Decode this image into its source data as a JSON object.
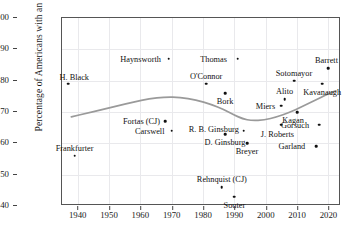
{
  "chart_data": {
    "type": "scatter",
    "title": "",
    "xlabel": "",
    "ylabel": "Percentage of Americans with an opinion",
    "xlim": [
      1935,
      2024
    ],
    "ylim": [
      40,
      100
    ],
    "xticks": [
      1940,
      1950,
      1960,
      1970,
      1980,
      1990,
      2000,
      2010,
      2020
    ],
    "yticks": [
      40,
      50,
      60,
      70,
      80,
      90,
      100
    ],
    "grid": true,
    "legend": "none",
    "points": [
      {
        "label": "Frankfurter",
        "x": 1939,
        "y": 56,
        "label_dx": 0,
        "label_dy": -8
      },
      {
        "label": "H. Black",
        "x": 1937,
        "y": 79,
        "label_dx": 6,
        "label_dy": -7
      },
      {
        "label": "Fortas (CJ)",
        "x": 1968,
        "y": 67,
        "label_dx": -24,
        "label_dy": 0
      },
      {
        "label": "Carswell",
        "x": 1970,
        "y": 64,
        "label_dx": -22,
        "label_dy": 0
      },
      {
        "label": "Haynsworth",
        "x": 1969,
        "y": 87,
        "label_dx": -28,
        "label_dy": 0
      },
      {
        "label": "O'Connor",
        "x": 1981,
        "y": 79,
        "label_dx": 0,
        "label_dy": -8
      },
      {
        "label": "Bork",
        "x": 1987,
        "y": 76,
        "label_dx": 0,
        "label_dy": 8
      },
      {
        "label": "Rehnquist (CJ)",
        "x": 1986,
        "y": 46,
        "label_dx": 0,
        "label_dy": -8
      },
      {
        "label": "Souter",
        "x": 1990,
        "y": 43,
        "label_dx": 0,
        "label_dy": 8
      },
      {
        "label": "Thomas",
        "x": 1991,
        "y": 87,
        "label_dx": -24,
        "label_dy": 0
      },
      {
        "label": "D. Ginsburg",
        "x": 1987,
        "y": 63,
        "label_dx": 0,
        "label_dy": 8
      },
      {
        "label": "R. B. Ginsburg",
        "x": 1993,
        "y": 64,
        "label_dx": -30,
        "label_dy": -2
      },
      {
        "label": "Breyer",
        "x": 1994,
        "y": 60,
        "label_dx": 0,
        "label_dy": 8
      },
      {
        "label": "Miers",
        "x": 2005,
        "y": 72,
        "label_dx": -16,
        "label_dy": 0
      },
      {
        "label": "Alito",
        "x": 2006,
        "y": 74,
        "label_dx": 0,
        "label_dy": -8
      },
      {
        "label": "Kagan",
        "x": 2010,
        "y": 70,
        "label_dx": -4,
        "label_dy": 8
      },
      {
        "label": "Sotomayor",
        "x": 2009,
        "y": 80,
        "label_dx": 0,
        "label_dy": -8
      },
      {
        "label": "J. Roberts",
        "x": 2005,
        "y": 66,
        "label_dx": -4,
        "label_dy": 9
      },
      {
        "label": "Gorsuch",
        "x": 2017,
        "y": 66,
        "label_dx": -24,
        "label_dy": 0
      },
      {
        "label": "Garland",
        "x": 2016,
        "y": 59,
        "label_dx": -24,
        "label_dy": 0
      },
      {
        "label": "Kavanaugh",
        "x": 2018,
        "y": 79,
        "label_dx": 0,
        "label_dy": 8
      },
      {
        "label": "Barrett",
        "x": 2020,
        "y": 84,
        "label_dx": -2,
        "label_dy": -8
      }
    ],
    "trend_line": {
      "name": "smoothed average",
      "color": "#9a9a9a",
      "x": [
        1938,
        1943,
        1948,
        1953,
        1958,
        1963,
        1968,
        1973,
        1978,
        1983,
        1987,
        1990,
        1993,
        1996,
        2000,
        2004,
        2008,
        2012,
        2016,
        2020,
        2023
      ],
      "y": [
        68.2,
        69.4,
        70.6,
        71.8,
        73.0,
        74.0,
        74.6,
        74.5,
        73.7,
        72.2,
        70.6,
        69.0,
        67.6,
        67.0,
        67.2,
        68.2,
        69.6,
        71.4,
        73.4,
        75.4,
        76.6
      ]
    }
  }
}
